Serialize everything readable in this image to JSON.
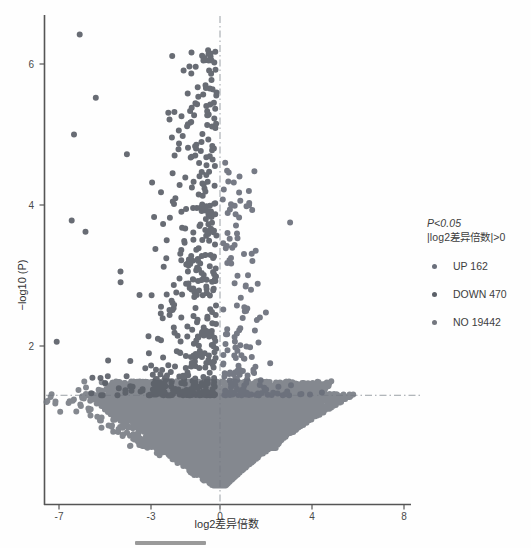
{
  "figure": {
    "background_color": "#fefefe",
    "axis_color": "#555555",
    "point_color": "#5b5f6b",
    "threshold_line_color": "#9aa0a6"
  },
  "chart_data": {
    "type": "scatter",
    "title": "",
    "subtitle": "",
    "xlabel": "log2差异倍数",
    "ylabel": "−log10 (P)",
    "xlim": [
      -8.2,
      8.6
    ],
    "ylim": [
      -0.15,
      7.0
    ],
    "xticks": [
      -7,
      -3,
      0,
      4,
      8
    ],
    "xticklabels": [
      "-7",
      "-3",
      "0",
      "4",
      "8"
    ],
    "yticks": [
      2,
      4,
      6
    ],
    "yticklabels": [
      "2",
      "4",
      "6"
    ],
    "grid": false,
    "legend_position": "right",
    "annotations": [
      {
        "name": "vertical-threshold",
        "type": "vline",
        "x": 0,
        "style": "dashdot"
      },
      {
        "name": "horizontal-threshold",
        "type": "hline",
        "y": 1.301,
        "style": "dashdot"
      }
    ],
    "legend": {
      "title_lines": [
        "P<0.05",
        "|log2差异倍数|>0"
      ],
      "entries": [
        {
          "label": "UP 162",
          "category": "UP",
          "count": 162,
          "color": "#6a6f7b"
        },
        {
          "label": "DOWN 470",
          "category": "DOWN",
          "count": 470,
          "color": "#5b6068"
        },
        {
          "label": "NO 19442",
          "category": "NO",
          "count": 19442,
          "color": "#73777f"
        }
      ]
    },
    "series": [
      {
        "name": "UP",
        "count": 162,
        "color": "#6a6f7b",
        "description": "Significant up-regulated genes: log2FC > 0 and -log10(P) > 1.301",
        "x_range": [
          0.05,
          5.4
        ],
        "y_range": [
          1.31,
          5.1
        ]
      },
      {
        "name": "DOWN",
        "count": 470,
        "color": "#5b6068",
        "description": "Significant down-regulated genes: log2FC < 0 and -log10(P) > 1.301",
        "x_range": [
          -7.3,
          -0.05
        ],
        "y_range": [
          1.31,
          6.45
        ]
      },
      {
        "name": "NO",
        "count": 19442,
        "color": "#73777f",
        "description": "Non-significant genes forming dense V-shaped cloud converging at x=0",
        "x_range": [
          -6.2,
          5.4
        ],
        "y_range": [
          0.0,
          1.301
        ]
      }
    ],
    "notable_points": [
      {
        "x": -6.1,
        "y": 6.42
      },
      {
        "x": -5.4,
        "y": 5.52
      },
      {
        "x": -6.35,
        "y": 5.0
      },
      {
        "x": -4.05,
        "y": 4.72
      },
      {
        "x": -2.95,
        "y": 4.32
      },
      {
        "x": -2.05,
        "y": 4.05
      },
      {
        "x": -6.45,
        "y": 3.78
      },
      {
        "x": -5.85,
        "y": 3.62
      },
      {
        "x": 3.05,
        "y": 3.75
      },
      {
        "x": 1.55,
        "y": 3.35
      },
      {
        "x": -7.1,
        "y": 2.06
      }
    ],
    "point_size": 3.0,
    "n_points_rendered": 20074
  }
}
